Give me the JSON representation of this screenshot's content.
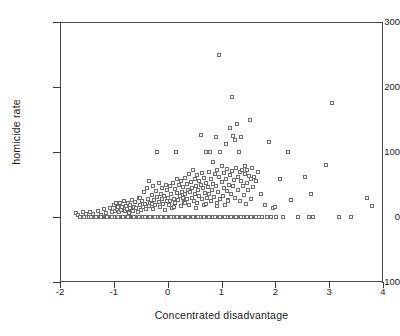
{
  "chart_data": {
    "type": "scatter",
    "title": "",
    "xlabel": "Concentrated disadvantage",
    "ylabel": "homicide rate",
    "xlim": [
      -2,
      4
    ],
    "ylim": [
      -100,
      300
    ],
    "xticks": [
      -2,
      -1,
      0,
      1,
      2,
      3,
      4
    ],
    "xticklabels": [
      "-2",
      "-1",
      "0",
      "1",
      "2",
      "3",
      "4"
    ],
    "yticks": [
      -100,
      0,
      100,
      200,
      300
    ],
    "yticklabels": [
      "-100",
      "0",
      "100",
      "200",
      "300"
    ],
    "grid": false,
    "legend": null,
    "marker": "open-square",
    "marker_color": "#6e6e6e",
    "frame_color": "#4a4a4a",
    "points": [
      [
        -1.7,
        6
      ],
      [
        -1.66,
        3
      ],
      [
        -1.62,
        0
      ],
      [
        -1.58,
        8
      ],
      [
        -1.55,
        0
      ],
      [
        -1.52,
        4
      ],
      [
        -1.5,
        0
      ],
      [
        -1.47,
        0
      ],
      [
        -1.44,
        7
      ],
      [
        -1.41,
        0
      ],
      [
        -1.38,
        5
      ],
      [
        -1.35,
        0
      ],
      [
        -1.32,
        0
      ],
      [
        -1.3,
        9
      ],
      [
        -1.27,
        0
      ],
      [
        -1.24,
        3
      ],
      [
        -1.22,
        0
      ],
      [
        -1.2,
        0
      ],
      [
        -1.18,
        12
      ],
      [
        -1.16,
        0
      ],
      [
        -1.14,
        6
      ],
      [
        -1.12,
        0
      ],
      [
        -1.1,
        0
      ],
      [
        -1.08,
        14
      ],
      [
        -1.06,
        0
      ],
      [
        -1.04,
        8
      ],
      [
        -1.02,
        0
      ],
      [
        -1.0,
        0
      ],
      [
        -0.99,
        18
      ],
      [
        -0.98,
        10
      ],
      [
        -0.97,
        0
      ],
      [
        -0.96,
        22
      ],
      [
        -0.95,
        0
      ],
      [
        -0.94,
        12
      ],
      [
        -0.93,
        0
      ],
      [
        -0.92,
        16
      ],
      [
        -0.91,
        0
      ],
      [
        -0.9,
        7
      ],
      [
        -0.89,
        0
      ],
      [
        -0.88,
        20
      ],
      [
        -0.87,
        0
      ],
      [
        -0.86,
        11
      ],
      [
        -0.85,
        0
      ],
      [
        -0.84,
        15
      ],
      [
        -0.83,
        0
      ],
      [
        -0.82,
        24
      ],
      [
        -0.81,
        0
      ],
      [
        -0.8,
        9
      ],
      [
        -0.79,
        0
      ],
      [
        -0.78,
        17
      ],
      [
        -0.77,
        0
      ],
      [
        -0.76,
        13
      ],
      [
        -0.75,
        0
      ],
      [
        -0.74,
        21
      ],
      [
        -0.73,
        0
      ],
      [
        -0.72,
        6
      ],
      [
        -0.71,
        0
      ],
      [
        -0.7,
        19
      ],
      [
        -0.69,
        0
      ],
      [
        -0.68,
        12
      ],
      [
        -0.67,
        0
      ],
      [
        -0.66,
        26
      ],
      [
        -0.65,
        0
      ],
      [
        -0.64,
        10
      ],
      [
        -0.63,
        0
      ],
      [
        -0.62,
        16
      ],
      [
        -0.61,
        0
      ],
      [
        -0.6,
        23
      ],
      [
        -0.59,
        0
      ],
      [
        -0.58,
        14
      ],
      [
        -0.57,
        0
      ],
      [
        -0.56,
        8
      ],
      [
        -0.55,
        0
      ],
      [
        -0.54,
        30
      ],
      [
        -0.53,
        0
      ],
      [
        -0.52,
        18
      ],
      [
        -0.51,
        0
      ],
      [
        -0.5,
        11
      ],
      [
        -0.49,
        0
      ],
      [
        -0.48,
        25
      ],
      [
        -0.47,
        0
      ],
      [
        -0.46,
        15
      ],
      [
        -0.45,
        0
      ],
      [
        -0.44,
        38
      ],
      [
        -0.43,
        0
      ],
      [
        -0.42,
        20
      ],
      [
        -0.41,
        0
      ],
      [
        -0.4,
        12
      ],
      [
        -0.39,
        45
      ],
      [
        -0.38,
        0
      ],
      [
        -0.37,
        28
      ],
      [
        -0.36,
        0
      ],
      [
        -0.35,
        17
      ],
      [
        -0.34,
        56
      ],
      [
        -0.33,
        0
      ],
      [
        -0.32,
        22
      ],
      [
        -0.31,
        0
      ],
      [
        -0.3,
        34
      ],
      [
        -0.29,
        0
      ],
      [
        -0.28,
        13
      ],
      [
        -0.27,
        48
      ],
      [
        -0.26,
        0
      ],
      [
        -0.25,
        26
      ],
      [
        -0.24,
        0
      ],
      [
        -0.23,
        19
      ],
      [
        -0.22,
        40
      ],
      [
        -0.21,
        0
      ],
      [
        -0.2,
        31
      ],
      [
        -0.19,
        100
      ],
      [
        -0.18,
        0
      ],
      [
        -0.17,
        23
      ],
      [
        -0.16,
        52
      ],
      [
        -0.15,
        0
      ],
      [
        -0.14,
        16
      ],
      [
        -0.13,
        36
      ],
      [
        -0.12,
        0
      ],
      [
        -0.11,
        27
      ],
      [
        -0.1,
        44
      ],
      [
        -0.09,
        0
      ],
      [
        -0.08,
        20
      ],
      [
        -0.07,
        33
      ],
      [
        -0.06,
        0
      ],
      [
        -0.05,
        11
      ],
      [
        -0.04,
        50
      ],
      [
        -0.03,
        0
      ],
      [
        -0.02,
        24
      ],
      [
        -0.01,
        41
      ],
      [
        0.0,
        0
      ],
      [
        0.01,
        30
      ],
      [
        0.02,
        18
      ],
      [
        0.03,
        0
      ],
      [
        0.04,
        47
      ],
      [
        0.05,
        25
      ],
      [
        0.06,
        0
      ],
      [
        0.07,
        35
      ],
      [
        0.08,
        14
      ],
      [
        0.09,
        0
      ],
      [
        0.1,
        53
      ],
      [
        0.11,
        28
      ],
      [
        0.12,
        0
      ],
      [
        0.13,
        43
      ],
      [
        0.14,
        21
      ],
      [
        0.15,
        100
      ],
      [
        0.16,
        0
      ],
      [
        0.17,
        37
      ],
      [
        0.18,
        58
      ],
      [
        0.19,
        26
      ],
      [
        0.2,
        0
      ],
      [
        0.21,
        49
      ],
      [
        0.22,
        32
      ],
      [
        0.23,
        0
      ],
      [
        0.24,
        17
      ],
      [
        0.25,
        55
      ],
      [
        0.26,
        39
      ],
      [
        0.27,
        0
      ],
      [
        0.28,
        29
      ],
      [
        0.29,
        46
      ],
      [
        0.3,
        0
      ],
      [
        0.31,
        23
      ],
      [
        0.32,
        60
      ],
      [
        0.33,
        35
      ],
      [
        0.34,
        0
      ],
      [
        0.35,
        51
      ],
      [
        0.36,
        27
      ],
      [
        0.37,
        0
      ],
      [
        0.38,
        42
      ],
      [
        0.39,
        66
      ],
      [
        0.4,
        19
      ],
      [
        0.41,
        0
      ],
      [
        0.42,
        38
      ],
      [
        0.43,
        54
      ],
      [
        0.44,
        0
      ],
      [
        0.45,
        30
      ],
      [
        0.46,
        45
      ],
      [
        0.47,
        72
      ],
      [
        0.48,
        0
      ],
      [
        0.49,
        24
      ],
      [
        0.5,
        58
      ],
      [
        0.51,
        36
      ],
      [
        0.52,
        0
      ],
      [
        0.53,
        48
      ],
      [
        0.54,
        64
      ],
      [
        0.55,
        21
      ],
      [
        0.56,
        0
      ],
      [
        0.57,
        41
      ],
      [
        0.58,
        56
      ],
      [
        0.59,
        33
      ],
      [
        0.6,
        0
      ],
      [
        0.61,
        126
      ],
      [
        0.62,
        50
      ],
      [
        0.63,
        27
      ],
      [
        0.64,
        68
      ],
      [
        0.65,
        0
      ],
      [
        0.66,
        44
      ],
      [
        0.67,
        60
      ],
      [
        0.68,
        18
      ],
      [
        0.69,
        0
      ],
      [
        0.7,
        37
      ],
      [
        0.71,
        100
      ],
      [
        0.72,
        53
      ],
      [
        0.73,
        29
      ],
      [
        0.74,
        0
      ],
      [
        0.75,
        46
      ],
      [
        0.76,
        70
      ],
      [
        0.77,
        35
      ],
      [
        0.78,
        0
      ],
      [
        0.79,
        100
      ],
      [
        0.8,
        58
      ],
      [
        0.81,
        25
      ],
      [
        0.82,
        42
      ],
      [
        0.83,
        0
      ],
      [
        0.84,
        85
      ],
      [
        0.85,
        51
      ],
      [
        0.86,
        31
      ],
      [
        0.87,
        66
      ],
      [
        0.88,
        0
      ],
      [
        0.89,
        123
      ],
      [
        0.9,
        47
      ],
      [
        0.91,
        22
      ],
      [
        0.92,
        73
      ],
      [
        0.93,
        0
      ],
      [
        0.94,
        38
      ],
      [
        0.95,
        250
      ],
      [
        0.96,
        61
      ],
      [
        0.97,
        28
      ],
      [
        0.98,
        100
      ],
      [
        0.99,
        0
      ],
      [
        1.0,
        54
      ],
      [
        1.01,
        78
      ],
      [
        1.02,
        33
      ],
      [
        1.03,
        0
      ],
      [
        1.04,
        45
      ],
      [
        1.05,
        67
      ],
      [
        1.06,
        19
      ],
      [
        1.07,
        0
      ],
      [
        1.08,
        112
      ],
      [
        1.09,
        59
      ],
      [
        1.1,
        40
      ],
      [
        1.11,
        74
      ],
      [
        1.12,
        0
      ],
      [
        1.13,
        26
      ],
      [
        1.14,
        50
      ],
      [
        1.15,
        137
      ],
      [
        1.16,
        64
      ],
      [
        1.17,
        0
      ],
      [
        1.18,
        36
      ],
      [
        1.19,
        185
      ],
      [
        1.2,
        71
      ],
      [
        1.21,
        124
      ],
      [
        1.22,
        48
      ],
      [
        1.23,
        0
      ],
      [
        1.24,
        57
      ],
      [
        1.25,
        118
      ],
      [
        1.26,
        30
      ],
      [
        1.27,
        76
      ],
      [
        1.28,
        0
      ],
      [
        1.29,
        143
      ],
      [
        1.3,
        62
      ],
      [
        1.31,
        42
      ],
      [
        1.32,
        100
      ],
      [
        1.33,
        0
      ],
      [
        1.34,
        69
      ],
      [
        1.35,
        24
      ],
      [
        1.36,
        55
      ],
      [
        1.37,
        123
      ],
      [
        1.38,
        0
      ],
      [
        1.39,
        73
      ],
      [
        1.4,
        47
      ],
      [
        1.41,
        34
      ],
      [
        1.42,
        0
      ],
      [
        1.43,
        66
      ],
      [
        1.44,
        79
      ],
      [
        1.45,
        20
      ],
      [
        1.46,
        0
      ],
      [
        1.47,
        52
      ],
      [
        1.48,
        72
      ],
      [
        1.49,
        0
      ],
      [
        1.5,
        41
      ],
      [
        1.51,
        63
      ],
      [
        1.52,
        0
      ],
      [
        1.53,
        150
      ],
      [
        1.54,
        58
      ],
      [
        1.55,
        27
      ],
      [
        1.56,
        0
      ],
      [
        1.57,
        75
      ],
      [
        1.58,
        46
      ],
      [
        1.59,
        0
      ],
      [
        1.6,
        61
      ],
      [
        1.62,
        0
      ],
      [
        1.64,
        56
      ],
      [
        1.66,
        0
      ],
      [
        1.68,
        70
      ],
      [
        1.7,
        0
      ],
      [
        1.73,
        36
      ],
      [
        1.76,
        0
      ],
      [
        1.8,
        18
      ],
      [
        1.85,
        0
      ],
      [
        1.88,
        116
      ],
      [
        1.92,
        0
      ],
      [
        1.96,
        14
      ],
      [
        2.0,
        15
      ],
      [
        2.02,
        0
      ],
      [
        2.08,
        58
      ],
      [
        2.15,
        0
      ],
      [
        2.24,
        100
      ],
      [
        2.3,
        26
      ],
      [
        2.42,
        0
      ],
      [
        2.55,
        62
      ],
      [
        2.62,
        0
      ],
      [
        2.66,
        35
      ],
      [
        2.7,
        0
      ],
      [
        2.95,
        80
      ],
      [
        3.05,
        175
      ],
      [
        3.18,
        0
      ],
      [
        3.4,
        0
      ],
      [
        3.7,
        30
      ],
      [
        3.8,
        17
      ],
      [
        -1.25,
        0
      ],
      [
        -1.15,
        0
      ],
      [
        -1.05,
        0
      ],
      [
        -0.95,
        0
      ],
      [
        -0.85,
        0
      ],
      [
        -0.75,
        0
      ],
      [
        -0.65,
        0
      ],
      [
        -0.55,
        0
      ],
      [
        -0.45,
        0
      ],
      [
        -0.35,
        0
      ],
      [
        -0.25,
        0
      ],
      [
        -0.15,
        0
      ],
      [
        -0.05,
        0
      ],
      [
        0.05,
        0
      ],
      [
        0.15,
        0
      ],
      [
        0.25,
        0
      ],
      [
        0.35,
        0
      ],
      [
        0.45,
        0
      ],
      [
        0.55,
        0
      ],
      [
        0.65,
        0
      ],
      [
        0.75,
        0
      ],
      [
        0.85,
        0
      ],
      [
        0.95,
        0
      ],
      [
        1.05,
        0
      ],
      [
        1.15,
        0
      ],
      [
        1.25,
        0
      ],
      [
        1.35,
        0
      ],
      [
        1.45,
        0
      ],
      [
        1.55,
        0
      ],
      [
        1.65,
        0
      ],
      [
        -1.43,
        0
      ],
      [
        -1.33,
        0
      ],
      [
        -1.23,
        0
      ],
      [
        -1.13,
        0
      ],
      [
        -1.03,
        0
      ],
      [
        -0.93,
        0
      ],
      [
        -0.83,
        0
      ],
      [
        -0.73,
        0
      ],
      [
        -0.63,
        0
      ],
      [
        -0.53,
        0
      ],
      [
        -0.43,
        0
      ],
      [
        -0.33,
        0
      ],
      [
        -0.23,
        0
      ],
      [
        -0.13,
        0
      ],
      [
        -0.03,
        0
      ],
      [
        0.07,
        0
      ],
      [
        0.17,
        0
      ],
      [
        0.27,
        0
      ],
      [
        0.37,
        0
      ],
      [
        0.47,
        0
      ],
      [
        0.57,
        0
      ],
      [
        0.67,
        0
      ],
      [
        0.77,
        0
      ],
      [
        0.87,
        0
      ],
      [
        0.97,
        0
      ],
      [
        1.07,
        0
      ],
      [
        1.17,
        0
      ],
      [
        1.27,
        0
      ],
      [
        1.37,
        0
      ],
      [
        1.47,
        0
      ],
      [
        -0.88,
        22
      ],
      [
        -0.7,
        14
      ],
      [
        -0.52,
        30
      ],
      [
        -0.3,
        20
      ],
      [
        -0.1,
        28
      ],
      [
        0.12,
        16
      ],
      [
        0.32,
        22
      ],
      [
        0.52,
        14
      ],
      [
        0.72,
        20
      ],
      [
        0.92,
        17
      ],
      [
        1.12,
        25
      ]
    ]
  }
}
